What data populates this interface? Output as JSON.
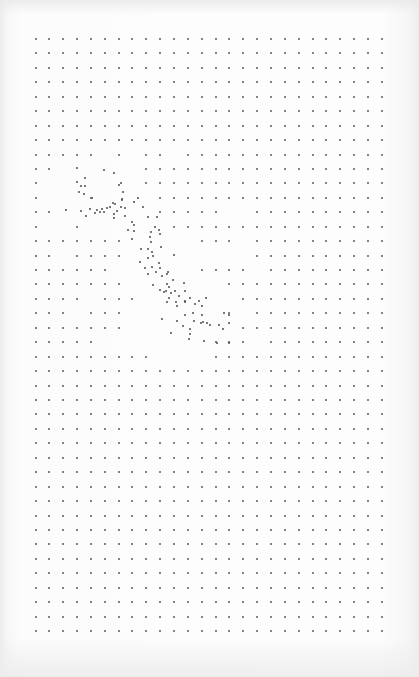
{
  "page": {
    "colors": {
      "paper": "#fcfcfc",
      "dot": "#5a5a5a",
      "scatter_dot": "#4e4e4e"
    }
  },
  "grid": {
    "columns": 26,
    "rows": 42,
    "missing_cells": {
      "8": [
        5,
        7,
        10
      ],
      "9": [
        2,
        3,
        4,
        5,
        6,
        7
      ],
      "10": [
        1,
        2,
        3,
        4,
        5,
        6,
        7
      ],
      "11": [
        1,
        2,
        3,
        5,
        6,
        7,
        8
      ],
      "12": [
        2,
        3,
        4,
        5,
        6,
        7,
        8,
        14,
        15
      ],
      "13": [
        1,
        2,
        4,
        5,
        6,
        7,
        8,
        9
      ],
      "14": [
        7,
        8,
        9,
        10,
        11,
        15
      ],
      "15": [
        2,
        7,
        8,
        9,
        10,
        11,
        12,
        13,
        14,
        15
      ],
      "16": [
        6,
        7,
        8,
        9,
        10,
        11,
        16
      ],
      "17": [
        7,
        8,
        9,
        10,
        11,
        12,
        13
      ],
      "18": [
        4,
        8,
        9,
        10,
        11,
        12,
        13,
        14
      ],
      "19": [
        3,
        7,
        8,
        9,
        10,
        11,
        12,
        13,
        15
      ],
      "20": [
        7,
        8,
        9,
        10,
        11,
        12,
        13,
        14
      ],
      "21": [
        5,
        6,
        7,
        8,
        9,
        10,
        11,
        12,
        16
      ],
      "22": [
        9,
        10,
        11,
        12
      ]
    }
  },
  "figure": {
    "scatter_points_grid_units": [
      [
        3.0,
        8.9
      ],
      [
        4.95,
        9.1
      ],
      [
        3.575,
        9.63
      ],
      [
        3.0,
        9.9
      ],
      [
        3.3,
        10.18
      ],
      [
        3.575,
        10.18
      ],
      [
        3.14,
        10.6
      ],
      [
        3.5,
        10.74
      ],
      [
        4.08,
        11.01
      ],
      [
        2.2,
        11.84
      ],
      [
        3.3,
        11.91
      ],
      [
        3.94,
        11.77
      ],
      [
        3.65,
        12.26
      ],
      [
        4.3,
        12.05
      ],
      [
        4.44,
        11.84
      ],
      [
        4.66,
        11.98
      ],
      [
        4.8,
        11.77
      ],
      [
        4.95,
        11.98
      ],
      [
        5.16,
        11.7
      ],
      [
        5.67,
        9.28
      ],
      [
        6.18,
        9.97
      ],
      [
        6.03,
        10.11
      ],
      [
        6.32,
        10.6
      ],
      [
        6.25,
        11.08
      ],
      [
        7.4,
        11.01
      ],
      [
        6.25,
        11.15
      ],
      [
        7.11,
        11.29
      ],
      [
        5.6,
        11.37
      ],
      [
        5.73,
        11.43
      ],
      [
        5.38,
        11.63
      ],
      [
        6.17,
        11.63
      ],
      [
        6.46,
        11.7
      ],
      [
        6.46,
        12.26
      ],
      [
        5.67,
        12.39
      ],
      [
        5.88,
        11.91
      ],
      [
        7.76,
        11.63
      ],
      [
        5.67,
        12.12
      ],
      [
        8.12,
        12.33
      ],
      [
        8.75,
        12.33
      ],
      [
        6.96,
        12.67
      ],
      [
        7.1,
        12.91
      ],
      [
        6.65,
        13.23
      ],
      [
        7.1,
        13.3
      ],
      [
        8.6,
        13.02
      ],
      [
        8.9,
        13.23
      ],
      [
        8.36,
        13.37
      ],
      [
        9.0,
        13.5
      ],
      [
        6.97,
        13.84
      ],
      [
        8.26,
        13.71
      ],
      [
        8.34,
        14.06
      ],
      [
        9.06,
        14.41
      ],
      [
        7.62,
        14.55
      ],
      [
        8.12,
        14.55
      ],
      [
        8.42,
        14.76
      ],
      [
        10.0,
        14.96
      ],
      [
        8.48,
        15.03
      ],
      [
        8.12,
        15.17
      ],
      [
        7.55,
        15.45
      ],
      [
        8.92,
        15.52
      ],
      [
        7.9,
        15.86
      ],
      [
        8.4,
        15.79
      ],
      [
        8.98,
        15.86
      ],
      [
        9.57,
        16.13
      ],
      [
        8.7,
        16.13
      ],
      [
        8.12,
        16.27
      ],
      [
        9.49,
        16.3
      ],
      [
        9.14,
        16.44
      ],
      [
        9.91,
        16.69
      ],
      [
        10.72,
        16.9
      ],
      [
        9.5,
        16.99
      ],
      [
        8.48,
        17.02
      ],
      [
        9.64,
        17.2
      ],
      [
        9.0,
        17.4
      ],
      [
        9.28,
        17.53
      ],
      [
        10.07,
        17.46
      ],
      [
        10.8,
        17.46
      ],
      [
        10.36,
        17.8
      ],
      [
        12.3,
        17.94
      ],
      [
        9.64,
        17.94
      ],
      [
        10.14,
        18.21
      ],
      [
        9.5,
        18.21
      ],
      [
        10.8,
        18.21
      ],
      [
        9.43,
        17.46
      ],
      [
        9.79,
        17.6
      ],
      [
        11.12,
        17.94
      ],
      [
        11.8,
        18.15
      ],
      [
        10.22,
        18.5
      ],
      [
        10.8,
        18.15
      ],
      [
        11.55,
        18.35
      ],
      [
        12.02,
        18.5
      ],
      [
        11.35,
        18.98
      ],
      [
        12.02,
        19.12
      ],
      [
        13.62,
        18.98
      ],
      [
        9.14,
        19.42
      ],
      [
        10.22,
        19.53
      ],
      [
        10.8,
        19.12
      ],
      [
        11.45,
        19.53
      ],
      [
        12.08,
        19.6
      ],
      [
        14.0,
        19.12
      ],
      [
        12.6,
        19.81
      ],
      [
        10.65,
        19.86
      ],
      [
        11.94,
        19.67
      ],
      [
        13.25,
        19.8
      ],
      [
        14.0,
        19.67
      ],
      [
        9.75,
        20.36
      ],
      [
        11.12,
        20.43
      ],
      [
        11.08,
        20.77
      ],
      [
        12.17,
        20.91
      ],
      [
        13.11,
        21.05
      ],
      [
        14.0,
        21.05
      ],
      [
        11.12,
        20.08
      ],
      [
        12.4,
        19.7
      ],
      [
        13.55,
        20.1
      ]
    ]
  }
}
